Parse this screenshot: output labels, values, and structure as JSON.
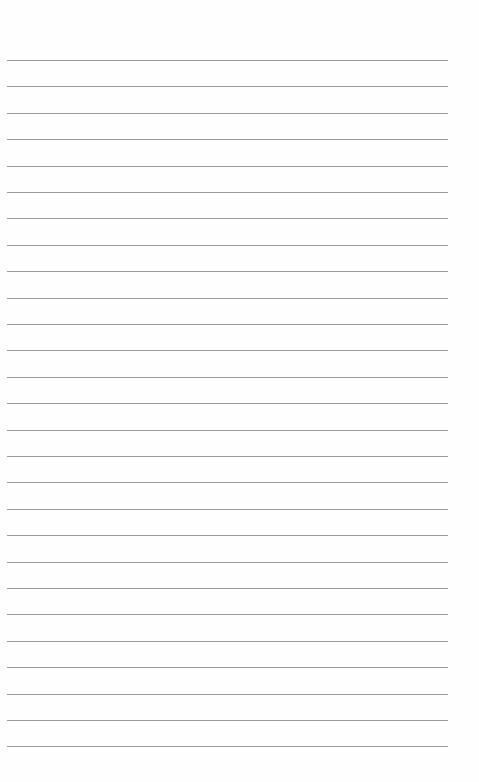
{
  "page": {
    "type": "blank ruled sheet",
    "line_count": 27,
    "first_line_y": 60,
    "line_spacing": 26.4,
    "line_left": 7,
    "line_width": 441,
    "line_color": "#9a9a9a",
    "background": "#fefefe"
  }
}
